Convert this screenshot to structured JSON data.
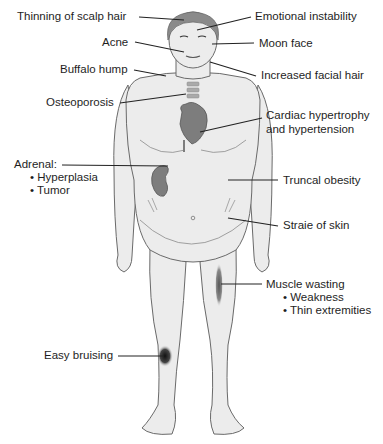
{
  "diagram": {
    "labels": {
      "thinning_scalp_hair": "Thinning of scalp hair",
      "emotional_instability": "Emotional instability",
      "acne": "Acne",
      "moon_face": "Moon face",
      "buffalo_hump": "Buffalo hump",
      "increased_facial_hair": "Increased facial hair",
      "osteoporosis": "Osteoporosis",
      "cardiac_line1": "Cardiac hypertrophy",
      "cardiac_line2": "and hypertension",
      "adrenal": "Adrenal:",
      "adrenal_items": [
        "• Hyperplasia",
        "• Tumor"
      ],
      "truncal_obesity": "Truncal obesity",
      "straie_of_skin": "Straie of skin",
      "muscle_wasting": "Muscle wasting",
      "muscle_items": [
        "• Weakness",
        "• Thin extremities"
      ],
      "easy_bruising": "Easy bruising"
    },
    "colors": {
      "skin": "#ececec",
      "outline": "#6a6a6a",
      "hair": "#8a8a8a",
      "organ": "#7d7d7d",
      "bruise": "#1e1e1e",
      "leader": "#222222"
    }
  }
}
